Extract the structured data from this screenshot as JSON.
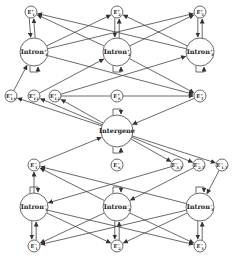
{
  "diagram": {
    "nodes": [
      {
        "id": "E1p",
        "label": "E",
        "sup": "+",
        "sub": "1",
        "x": 31,
        "y": 12,
        "r": 6
      },
      {
        "id": "E2p",
        "label": "E",
        "sup": "+",
        "sub": "2",
        "x": 117,
        "y": 12,
        "r": 6
      },
      {
        "id": "E3p",
        "label": "E",
        "sup": "+",
        "sub": "3",
        "x": 200,
        "y": 12,
        "r": 6
      },
      {
        "id": "I1p",
        "label": "Intron",
        "sup": "+",
        "sub": "1",
        "x": 34,
        "y": 52,
        "r": 14
      },
      {
        "id": "I2p",
        "label": "Intron",
        "sup": "+",
        "sub": "2",
        "x": 117,
        "y": 52,
        "r": 14
      },
      {
        "id": "I3p",
        "label": "Intron",
        "sup": "+",
        "sub": "3",
        "x": 200,
        "y": 52,
        "r": 14
      },
      {
        "id": "EIsp",
        "label": "E",
        "sup": "+",
        "sub": "I,S",
        "x": 11,
        "y": 96,
        "r": 6
      },
      {
        "id": "EI1p",
        "label": "E",
        "sup": "+",
        "sub": "I,1",
        "x": 34,
        "y": 96,
        "r": 6
      },
      {
        "id": "EI2p",
        "label": "E",
        "sup": "+",
        "sub": "I,2",
        "x": 55,
        "y": 96,
        "r": 6
      },
      {
        "id": "Esp",
        "label": "E",
        "sup": "+",
        "sub": "S",
        "x": 117,
        "y": 96,
        "r": 6
      },
      {
        "id": "ETp",
        "label": "E",
        "sup": "+",
        "sub": "T",
        "x": 200,
        "y": 96,
        "r": 6
      },
      {
        "id": "IG",
        "label": "Intergene",
        "sup": "",
        "sub": "",
        "x": 117,
        "y": 131,
        "r": 16
      },
      {
        "id": "ETm",
        "label": "E",
        "sup": "−",
        "sub": "T",
        "x": 34,
        "y": 165,
        "r": 6
      },
      {
        "id": "ESm",
        "label": "E",
        "sup": "−",
        "sub": "S",
        "x": 117,
        "y": 165,
        "r": 6
      },
      {
        "id": "EI3m",
        "label": "E",
        "sup": "−",
        "sub": "3,T",
        "x": 177,
        "y": 165,
        "r": 6
      },
      {
        "id": "EI2m",
        "label": "E",
        "sup": "−",
        "sub": "2,T",
        "x": 199,
        "y": 165,
        "r": 6
      },
      {
        "id": "EI1m",
        "label": "E",
        "sup": "−",
        "sub": "1,T",
        "x": 222,
        "y": 165,
        "r": 6
      },
      {
        "id": "I1m",
        "label": "Intron",
        "sup": "−",
        "sub": "1",
        "x": 34,
        "y": 207,
        "r": 14
      },
      {
        "id": "I2m",
        "label": "Intron",
        "sup": "−",
        "sub": "2",
        "x": 117,
        "y": 207,
        "r": 14
      },
      {
        "id": "I3m",
        "label": "Intron",
        "sup": "−",
        "sub": "3",
        "x": 200,
        "y": 207,
        "r": 14
      },
      {
        "id": "E1m",
        "label": "E",
        "sup": "−",
        "sub": "1",
        "x": 34,
        "y": 246,
        "r": 6
      },
      {
        "id": "E2m",
        "label": "E",
        "sup": "−",
        "sub": "2",
        "x": 117,
        "y": 246,
        "r": 6
      },
      {
        "id": "E3m",
        "label": "E",
        "sup": "−",
        "sub": "3",
        "x": 200,
        "y": 246,
        "r": 6
      }
    ],
    "edges": [
      [
        "I1p",
        "E1p"
      ],
      [
        "E1p",
        "I1p"
      ],
      [
        "I2p",
        "E2p"
      ],
      [
        "E2p",
        "I2p"
      ],
      [
        "I3p",
        "E3p"
      ],
      [
        "E3p",
        "I3p"
      ],
      [
        "I1p",
        "E2p"
      ],
      [
        "I1p",
        "E3p"
      ],
      [
        "I2p",
        "E1p"
      ],
      [
        "I2p",
        "E3p"
      ],
      [
        "I3p",
        "E1p"
      ],
      [
        "I3p",
        "E2p"
      ],
      [
        "EIsp",
        "I1p"
      ],
      [
        "EI1p",
        "I2p"
      ],
      [
        "EI2p",
        "I3p"
      ],
      [
        "I1p",
        "ETp"
      ],
      [
        "I2p",
        "ETp"
      ],
      [
        "EI2p",
        "ETp"
      ],
      [
        "IG",
        "EIsp"
      ],
      [
        "IG",
        "EI1p"
      ],
      [
        "IG",
        "EI2p"
      ],
      [
        "ETp",
        "IG"
      ],
      [
        "IG",
        "EI3m"
      ],
      [
        "IG",
        "EI2m"
      ],
      [
        "IG",
        "EI1m"
      ],
      [
        "ETm",
        "IG"
      ],
      [
        "I1m",
        "ETm"
      ],
      [
        "I2m",
        "ETm"
      ],
      [
        "I3m",
        "ETm"
      ],
      [
        "EI3m",
        "I1m"
      ],
      [
        "EI2m",
        "I2m"
      ],
      [
        "EI1m",
        "I3m"
      ],
      [
        "I1m",
        "E1m"
      ],
      [
        "E1m",
        "I1m"
      ],
      [
        "I2m",
        "E2m"
      ],
      [
        "E2m",
        "I2m"
      ],
      [
        "I3m",
        "E3m"
      ],
      [
        "E3m",
        "I3m"
      ],
      [
        "I1m",
        "E2m"
      ],
      [
        "I1m",
        "E3m"
      ],
      [
        "I2m",
        "E1m"
      ],
      [
        "I2m",
        "E3m"
      ],
      [
        "I3m",
        "E1m"
      ],
      [
        "I3m",
        "E2m"
      ]
    ],
    "self_loops": [
      {
        "node": "I1p",
        "side": "bottom"
      },
      {
        "node": "I2p",
        "side": "bottom"
      },
      {
        "node": "I3p",
        "side": "bottom"
      },
      {
        "node": "IG",
        "side": "top"
      },
      {
        "node": "IG",
        "side": "bottom"
      },
      {
        "node": "I1m",
        "side": "top"
      },
      {
        "node": "I2m",
        "side": "top"
      },
      {
        "node": "I3m",
        "side": "top"
      }
    ]
  }
}
